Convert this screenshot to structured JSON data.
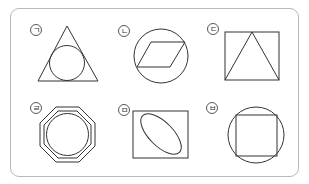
{
  "figure": {
    "panels": [
      {
        "label": "ㄱ",
        "description": "circle inscribed in triangle"
      },
      {
        "label": "ㄴ",
        "description": "parallelogram inscribed in circle"
      },
      {
        "label": "ㄷ",
        "description": "triangle inscribed in square"
      },
      {
        "label": "ㄹ",
        "description": "circle inside double octagon"
      },
      {
        "label": "ㅁ",
        "description": "ellipse inside rectangle"
      },
      {
        "label": "ㅂ",
        "description": "square inscribed in circle"
      }
    ],
    "colors": {
      "stroke": "#333333",
      "frame": "#b8b8b8",
      "background": "#ffffff"
    }
  }
}
